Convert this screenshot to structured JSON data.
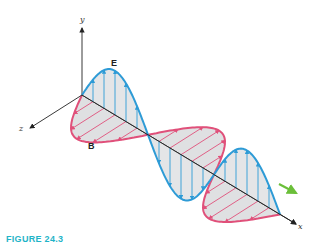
{
  "figure": {
    "labels": {
      "y_axis": "y",
      "z_axis": "z",
      "x_axis": "x",
      "electric_field": "E",
      "magnetic_field": "B"
    },
    "caption": "FIGURE 24.3  ",
    "colors": {
      "electric": "#2e9bd6",
      "magnetic": "#e0507a",
      "fill": "#d9dadd",
      "axis": "#222222",
      "propagation_arrow": "#6bbf3a",
      "caption": "#1fb4c8"
    },
    "geometry": {
      "origin": [
        82,
        95
      ],
      "x_axis_end": [
        296,
        224
      ],
      "y_axis_end": [
        82,
        28
      ],
      "z_axis_end": [
        30,
        128
      ],
      "half_wavelength_px": 66,
      "half_waves": 3,
      "e_amplitude": 44,
      "b_amplitude": 45,
      "arrows_per_half_wave": 5
    }
  }
}
